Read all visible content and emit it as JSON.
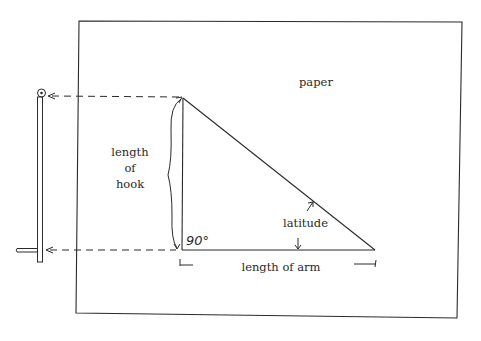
{
  "diagram": {
    "labels": {
      "paper": "paper",
      "hook_line1": "length",
      "hook_line2": "of",
      "hook_line3": "hook",
      "latitude": "latitude",
      "arm": "length of arm",
      "angle": "90°"
    },
    "colors": {
      "ink": "#2a2a2a",
      "background": "#ffffff"
    }
  }
}
